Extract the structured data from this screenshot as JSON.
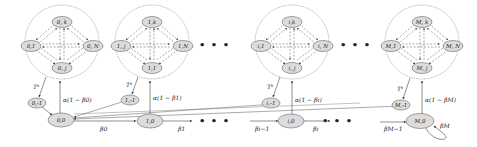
{
  "colors": {
    "node_fill": "#dcdcdc",
    "node_stroke": "#666666",
    "edge": "#555555",
    "cluster_stroke": "#888888",
    "background": "#ffffff"
  },
  "clusters": [
    {
      "id": "0",
      "nodes": {
        "top": "0, k",
        "left": "0,1",
        "right": "0, N",
        "bottom": "0, j"
      },
      "exit_node": "0,-1",
      "tau_label": "T^s",
      "up_label": "α(1 − β0)",
      "base_node": "0,0",
      "out_label": "β0"
    },
    {
      "id": "1",
      "nodes": {
        "top": "1,k",
        "left": "1, j",
        "right": "1,N",
        "bottom": "1,1"
      },
      "exit_node": "1,-1",
      "tau_label": "T^s",
      "up_label": "α(1 − β1)",
      "base_node": "1,0",
      "out_label": "β1"
    },
    {
      "id": "i",
      "nodes": {
        "top": "i,k",
        "left": "i,1",
        "right": "i, N",
        "bottom": "i, j"
      },
      "exit_node": "i,-1",
      "tau_label": "T^s",
      "up_label": "α(1 − βi)",
      "base_node": "i,0",
      "in_label": "βi−1",
      "out_label": "βi"
    },
    {
      "id": "M",
      "nodes": {
        "top": "M, k",
        "left": "M,1",
        "right": "M, N",
        "bottom": "M, j"
      },
      "exit_node": "M,-1",
      "tau_label": "T^s",
      "up_label": "α(1 − βM)",
      "base_node": "M,0",
      "in_label": "βM−1",
      "self_loop_label": "βM"
    }
  ],
  "ellipsis": "• • •"
}
